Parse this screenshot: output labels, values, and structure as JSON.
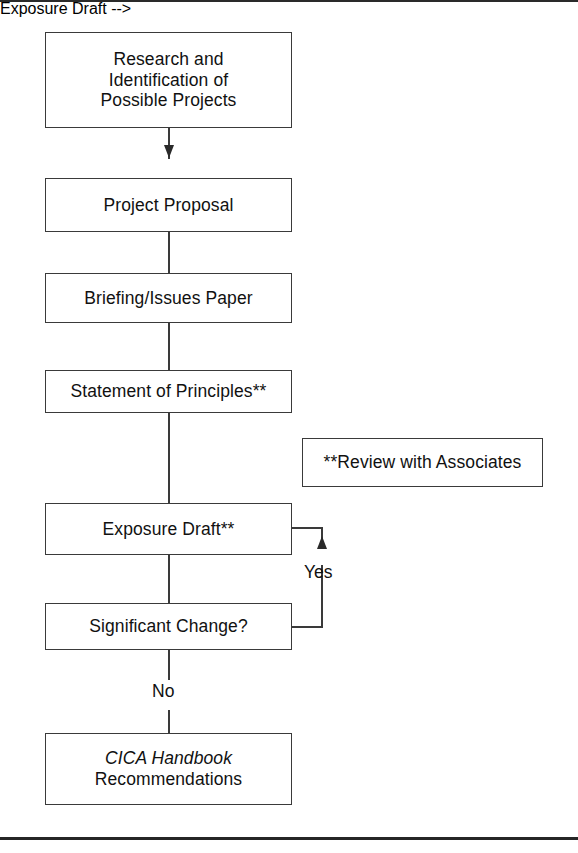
{
  "diagram": {
    "nodes": {
      "research": {
        "line1": "Research and",
        "line2": "Identification of",
        "line3": "Possible Projects"
      },
      "proposal": {
        "label": "Project Proposal"
      },
      "briefing": {
        "label": "Briefing/Issues Paper"
      },
      "principles": {
        "label": "Statement of Principles**"
      },
      "exposure": {
        "label": "Exposure Draft**"
      },
      "significant": {
        "label": "Significant Change?"
      },
      "handbook": {
        "line1": "CICA Handbook",
        "line2": "Recommendations"
      },
      "review_note": {
        "label": "**Review with Associates"
      }
    },
    "edge_labels": {
      "yes": "Yes",
      "no": "No"
    },
    "colors": {
      "background": "#ffffff",
      "box_border": "#3a3a3a",
      "connector": "#3a3a3a",
      "text": "#111111",
      "page_rule": "#2a2a2a"
    }
  }
}
